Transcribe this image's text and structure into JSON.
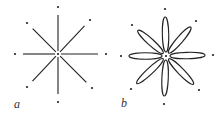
{
  "figure": {
    "panels": [
      {
        "label": "a",
        "style": "lines",
        "center": [
          58,
          54
        ],
        "outer_dots": [
          [
            58,
            7
          ],
          [
            90,
            20
          ],
          [
            106,
            54
          ],
          [
            92,
            88
          ],
          [
            58,
            102
          ],
          [
            27,
            87
          ],
          [
            15,
            54
          ],
          [
            27,
            23
          ]
        ],
        "description": "Eight radial line segments from a central point toward eight surrounding dots"
      },
      {
        "label": "b",
        "style": "ellipses",
        "center": [
          166,
          56
        ],
        "outer_dots": [
          [
            165,
            9
          ],
          [
            196,
            21
          ],
          [
            213,
            55
          ],
          [
            199,
            90
          ],
          [
            164,
            104
          ],
          [
            131,
            89
          ],
          [
            121,
            56
          ],
          [
            132,
            25
          ]
        ],
        "description": "Eight elongated ellipses (petals) arranged radially around a central point, with eight surrounding dots"
      }
    ],
    "colors": {
      "stroke": "#222222",
      "background": "#ffffff"
    }
  }
}
